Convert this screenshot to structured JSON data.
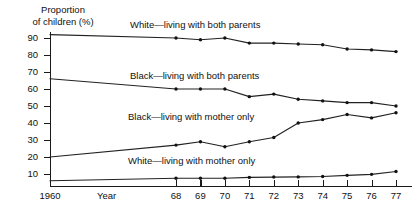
{
  "chart_data": {
    "type": "line",
    "title": "",
    "ylabel": "Proportion\nof children (%)",
    "xlabel": "Year",
    "ylim": [
      0,
      95
    ],
    "yticks": [
      10,
      20,
      30,
      40,
      50,
      60,
      70,
      80,
      90
    ],
    "grid": false,
    "legend_position": "inline-labels",
    "axis_break": true,
    "categories": [
      "1960",
      "68",
      "69",
      "70",
      "71",
      "72",
      "73",
      "74",
      "75",
      "76",
      "77"
    ],
    "x": [
      1960,
      1968,
      1969,
      1970,
      1971,
      1972,
      1973,
      1974,
      1975,
      1976,
      1977
    ],
    "series": [
      {
        "name": "White—living with both parents",
        "label": "White—living with both parents",
        "values": [
          92,
          90,
          89,
          90,
          87,
          87,
          86.5,
          86,
          83.5,
          83,
          82
        ]
      },
      {
        "name": "Black—living with both parents",
        "label": "Black—living with both parents",
        "values": [
          66,
          60,
          60,
          60,
          55.5,
          57,
          54,
          53,
          52,
          52,
          50
        ]
      },
      {
        "name": "Black—living with mother only",
        "label": "Black—living with mother only",
        "values": [
          20,
          27,
          29,
          26,
          29,
          31.5,
          40,
          42,
          45,
          43,
          46
        ]
      },
      {
        "name": "White—living with mother only",
        "label": "White—living with mother only",
        "values": [
          6,
          7.5,
          7.5,
          7.5,
          8,
          8.2,
          8.3,
          8.5,
          9.2,
          9.8,
          11.5
        ]
      }
    ]
  },
  "axis": {
    "y_title": "Proportion\nof children (%)",
    "x_title": "Year",
    "first_x_label": "1960"
  },
  "colors": {
    "line": "#222222",
    "marker": "#111111",
    "axis": "#1a1a1a",
    "background": "#ffffff",
    "text": "#111111"
  }
}
